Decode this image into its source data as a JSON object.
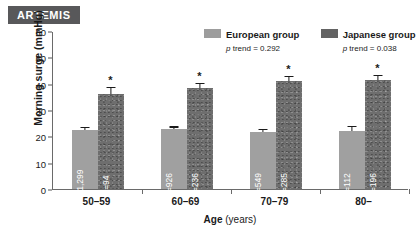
{
  "study": {
    "badge_label": "ARTEMIS"
  },
  "legend": {
    "position": "top-center-right",
    "entries": [
      {
        "label": "European group",
        "trend_prefix": "p",
        "trend_text": " trend = 0.292",
        "swatch_color": "#9d9d9d",
        "swatch_name": "european-swatch"
      },
      {
        "label": "Japanese group",
        "trend_prefix": "p",
        "trend_text": " trend = 0.038",
        "swatch_color": "#636363",
        "swatch_name": "japanese-swatch"
      }
    ]
  },
  "chart_data": {
    "type": "bar",
    "title": "ARTEMIS",
    "xlabel": "Age (years)",
    "xlabel_name": "Age",
    "xlabel_unit": "(years)",
    "ylabel": "Morning surge (mmHg)",
    "categories": [
      "50–59",
      "60–69",
      "70–79",
      "80–"
    ],
    "ylim": [
      0,
      60
    ],
    "yticks": [
      0,
      10,
      20,
      30,
      40,
      50,
      60
    ],
    "grid": false,
    "series": [
      {
        "name": "European group",
        "color": "#a0a0a0",
        "values": [
          22.5,
          22.8,
          21.5,
          22.0
        ],
        "errors": [
          0.5,
          0.5,
          0.8,
          1.6
        ],
        "n_labels": [
          "n=1,299",
          "n=926",
          "n=549",
          "n=112"
        ],
        "significance": [
          "",
          "",
          "",
          ""
        ],
        "p_trend": 0.292
      },
      {
        "name": "Japanese group",
        "color": "#6e6e6e",
        "values": [
          36.2,
          38.5,
          41.0,
          41.5
        ],
        "errors": [
          2.2,
          1.3,
          1.6,
          1.5
        ],
        "n_labels": [
          "n=94",
          "n=236",
          "n=285",
          "n=196"
        ],
        "significance": [
          "*",
          "*",
          "*",
          "*"
        ],
        "p_trend": 0.038
      }
    ],
    "significance_marker": "*"
  }
}
